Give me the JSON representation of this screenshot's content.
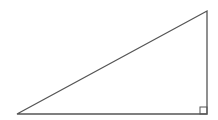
{
  "diagram": {
    "type": "right-triangle",
    "stroke_color": "#555555",
    "background": "#ffffff",
    "vertices": {
      "left": [
        17,
        114
      ],
      "right_angle": [
        207,
        114
      ],
      "top": [
        207,
        11
      ]
    },
    "right_angle_marker": {
      "x": 200,
      "y": 107,
      "size": 7
    }
  }
}
